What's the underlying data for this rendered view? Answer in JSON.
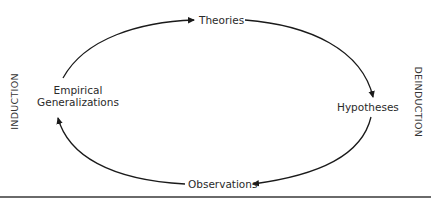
{
  "diagram": {
    "nodes": {
      "theories": "Theories",
      "hypotheses": "Hypotheses",
      "observations": "Observations",
      "generalizations_line1": "Empirical",
      "generalizations_line2": "Generalizations"
    },
    "side_labels": {
      "left": "INDUCTION",
      "right": "DEINDUCTION"
    },
    "edges": [
      {
        "from": "Empirical Generalizations",
        "to": "Theories"
      },
      {
        "from": "Theories",
        "to": "Hypotheses"
      },
      {
        "from": "Hypotheses",
        "to": "Observations"
      },
      {
        "from": "Observations",
        "to": "Empirical Generalizations"
      }
    ],
    "colors": {
      "stroke": "#1a1a1a",
      "rule": "#6a6a6a"
    }
  }
}
